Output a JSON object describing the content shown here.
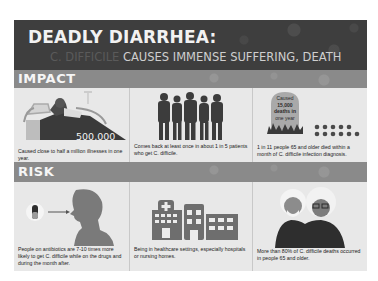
{
  "title": {
    "main": "DEADLY DIARRHEA:",
    "sub_faded": "C. DIFFICILE ",
    "sub": "CAUSES IMMENSE SUFFERING, DEATH"
  },
  "sections": {
    "impact": {
      "label": "IMPACT",
      "cards": [
        {
          "icon": "hospital-bed-patient-icon",
          "stat": "500,000",
          "caption": "Caused close to half a million illnesses in one year."
        },
        {
          "icon": "people-group-icon",
          "caption": "Comes back at least once in about 1 in 5 patients who get C. difficile."
        },
        {
          "icon": "tombstone-icon",
          "tombstone_lines": [
            "Caused",
            "15,000",
            "deaths in",
            "one year"
          ],
          "dots": {
            "top_row": 5,
            "bottom_row": 6
          },
          "caption": "1 in 11 people 65 and older died within a month of C. difficile infection diagnosis."
        }
      ]
    },
    "risk": {
      "label": "RISK",
      "cards": [
        {
          "icon": "pill-to-person-icon",
          "caption": "People on antibiotics are 7-10 times more likely to get C. difficile while on the drugs and during the month after."
        },
        {
          "icon": "hospital-building-icon",
          "caption": "Being in healthcare settings, especially hospitals or nursing homes."
        },
        {
          "icon": "elderly-couple-icon",
          "caption": "More than 80% of C. difficile deaths occurred in people 65 and older."
        }
      ]
    }
  },
  "colors": {
    "title_bg": "#3e3e3e",
    "band_bg": "#8a8a8a",
    "panel_bg": "#e8e8e8",
    "icon_dark": "#3c3c3c",
    "icon_mid": "#7a7a7a"
  }
}
